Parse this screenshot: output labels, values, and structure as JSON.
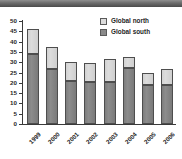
{
  "chart_data": {
    "type": "bar",
    "stacked": true,
    "title": "",
    "xlabel": "",
    "ylabel": "",
    "ylim": [
      0,
      50
    ],
    "yticks": [
      0,
      5,
      10,
      15,
      20,
      25,
      30,
      35,
      40,
      45,
      50
    ],
    "grid": false,
    "legend_position": "top-right",
    "categories": [
      "1999",
      "2000",
      "2001",
      "2002",
      "2003",
      "2004",
      "2005",
      "2006"
    ],
    "series": [
      {
        "name": "Global south",
        "color": "#8a8a8a",
        "values": [
          34,
          26.5,
          21,
          20.5,
          20.5,
          27,
          19,
          19
        ]
      },
      {
        "name": "Global north",
        "color": "#dcdcdc",
        "values": [
          12,
          11,
          9,
          9,
          11,
          5.5,
          6,
          7.5
        ]
      }
    ],
    "totals": [
      46,
      37.5,
      30,
      29.5,
      31.5,
      32.5,
      25,
      26.5
    ]
  },
  "legend": {
    "items": [
      {
        "label": "Global north",
        "swatch": "north"
      },
      {
        "label": "Global south",
        "swatch": "south"
      }
    ]
  }
}
